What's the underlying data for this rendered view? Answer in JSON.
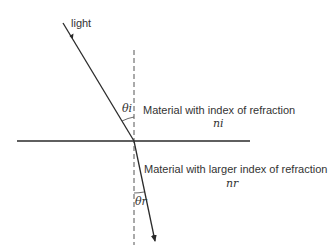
{
  "diagram": {
    "labels": {
      "light": "light",
      "theta_i": "θi",
      "theta_r": "θr",
      "upper_material": "Material with index of refraction",
      "upper_index": "ni",
      "lower_material": "Material with larger index of refraction",
      "lower_index": "nr"
    },
    "elements": {
      "incident_ray": {
        "from": [
          63,
          23
        ],
        "to": [
          134,
          141
        ],
        "arrow": "mid"
      },
      "refracted_ray": {
        "from": [
          134,
          141
        ],
        "to": [
          155,
          241
        ],
        "arrow": "end"
      },
      "interface_line": {
        "from": [
          17,
          141
        ],
        "to": [
          250,
          141
        ]
      },
      "normal_line": {
        "from": [
          134,
          50
        ],
        "to": [
          134,
          245
        ],
        "style": "dashed"
      }
    },
    "colors": {
      "line": "#2a2a2a",
      "background": "#ffffff"
    }
  }
}
